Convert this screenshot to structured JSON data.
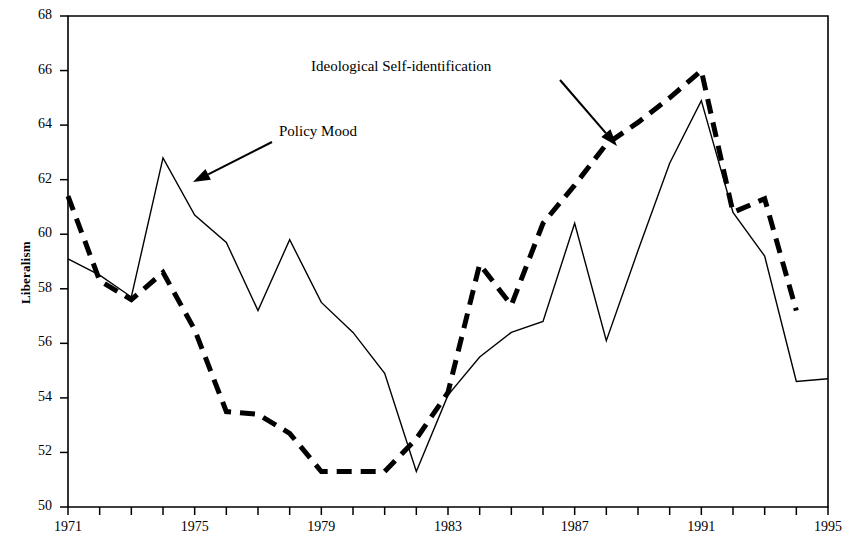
{
  "chart_data": {
    "type": "line",
    "title": "",
    "subtitle": "",
    "xlabel": "",
    "ylabel": "Liberalism",
    "xlim": [
      1971,
      1995
    ],
    "ylim": [
      50,
      68
    ],
    "grid": false,
    "legend_position": "inline-annotations",
    "x_ticks": [
      1971,
      1972,
      1973,
      1974,
      1975,
      1976,
      1977,
      1978,
      1979,
      1980,
      1981,
      1982,
      1983,
      1984,
      1985,
      1986,
      1987,
      1988,
      1989,
      1990,
      1991,
      1992,
      1993,
      1994,
      1995
    ],
    "x_tick_labels": [
      "1971",
      "",
      "",
      "",
      "1975",
      "",
      "",
      "",
      "1979",
      "",
      "",
      "",
      "1983",
      "",
      "",
      "",
      "1987",
      "",
      "",
      "",
      "1991",
      "",
      "",
      "",
      "1995"
    ],
    "y_ticks": [
      50,
      52,
      54,
      56,
      58,
      60,
      62,
      64,
      66,
      68
    ],
    "y_tick_labels": [
      "50",
      "52",
      "54",
      "56",
      "58",
      "60",
      "62",
      "64",
      "66",
      "68"
    ],
    "x": [
      1971,
      1972,
      1973,
      1974,
      1975,
      1976,
      1977,
      1978,
      1979,
      1980,
      1981,
      1982,
      1983,
      1984,
      1985,
      1986,
      1987,
      1988,
      1989,
      1990,
      1991,
      1992,
      1993,
      1994,
      1995
    ],
    "series": [
      {
        "name": "Policy Mood",
        "style": "solid",
        "color": "#000000",
        "line_width": 1.4,
        "values": [
          59.1,
          58.5,
          57.7,
          62.8,
          60.7,
          59.7,
          57.2,
          59.8,
          57.5,
          56.4,
          54.9,
          51.3,
          54.1,
          55.5,
          56.4,
          56.8,
          60.4,
          56.1,
          59.4,
          62.6,
          64.9,
          60.8,
          59.2,
          54.6,
          54.7
        ]
      },
      {
        "name": "Ideological Self-identification",
        "style": "dashed",
        "color": "#000000",
        "line_width": 5,
        "values": [
          61.4,
          58.3,
          57.6,
          58.6,
          56.5,
          53.5,
          53.4,
          52.7,
          51.3,
          51.3,
          51.3,
          52.5,
          54.2,
          58.9,
          57.4,
          60.4,
          61.8,
          63.3,
          64.1,
          65.0,
          66.0,
          60.8,
          61.3,
          57.2,
          null
        ]
      }
    ],
    "annotations": [
      {
        "text": "Ideological Self-identification",
        "label_x": 311,
        "label_y": 58,
        "arrow_from_x": 560,
        "arrow_from_y": 80,
        "arrow_to_x": 617,
        "arrow_to_y": 146
      },
      {
        "text": "Policy Mood",
        "label_x": 279,
        "label_y": 123,
        "arrow_from_x": 272,
        "arrow_from_y": 142,
        "arrow_to_x": 193,
        "arrow_to_y": 182
      }
    ]
  },
  "axis": {
    "y_title": "Liberalism"
  }
}
